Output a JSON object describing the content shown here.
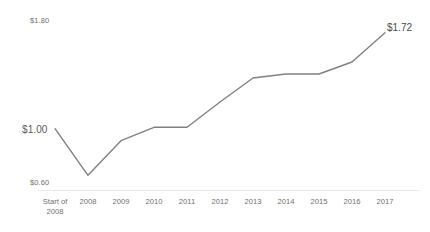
{
  "chart_data": {
    "type": "line",
    "title": "",
    "subtitle": "",
    "xlabel": "",
    "ylabel": "",
    "categories": [
      "Start of\n2008",
      "2008",
      "2009",
      "2010",
      "2011",
      "2012",
      "2013",
      "2014",
      "2015",
      "2016",
      "2017"
    ],
    "values": [
      1.0,
      0.65,
      0.91,
      1.01,
      1.01,
      1.2,
      1.38,
      1.41,
      1.41,
      1.5,
      1.72
    ],
    "ylim": [
      0.6,
      1.8
    ],
    "ytick_labels": [
      "$1.80",
      "$1.00",
      "$0.60"
    ],
    "ytick_values": [
      1.8,
      1.0,
      0.6
    ],
    "grid": false,
    "legend": "none",
    "annotations": [
      {
        "name": "start-value-label",
        "text": "$1.00",
        "at_category": "Start of\n2008",
        "value": 1.0
      },
      {
        "name": "end-value-label",
        "text": "$1.72",
        "at_category": "2017",
        "value": 1.72
      }
    ],
    "series": [
      {
        "name": "value",
        "color": "#808080",
        "values": [
          1.0,
          0.65,
          0.91,
          1.01,
          1.01,
          1.2,
          1.38,
          1.41,
          1.41,
          1.5,
          1.72
        ]
      }
    ]
  },
  "axis": {
    "y_top_label": "$1.80",
    "y_mid_label": "$1.00",
    "y_bottom_label": "$0.60",
    "x_labels": [
      "Start of\n2008",
      "2008",
      "2009",
      "2010",
      "2011",
      "2012",
      "2013",
      "2014",
      "2015",
      "2016",
      "2017"
    ]
  },
  "labels": {
    "end_value": "$1.72"
  },
  "colors": {
    "line": "#808080",
    "axis_text": "#6f6f6f",
    "axis_line": "#e8e8e8",
    "background": "#ffffff"
  }
}
